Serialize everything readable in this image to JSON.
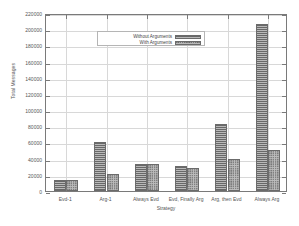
{
  "chart_data": {
    "type": "bar",
    "title": "",
    "xlabel": "Strategy",
    "ylabel": "Total Messages",
    "categories": [
      "Evd-1",
      "Arg-1",
      "Always Evd",
      "Evd, Finally Arg",
      "Arg, then Evd",
      "Always Arg"
    ],
    "series": [
      {
        "name": "Without Arguments",
        "values": [
          14000,
          61000,
          33500,
          31000,
          82500,
          206000
        ]
      },
      {
        "name": "With Arguments",
        "values": [
          14000,
          21000,
          33500,
          29000,
          39000,
          51000
        ]
      }
    ],
    "ylim": [
      0,
      220000
    ],
    "ytick_step": 20000,
    "ytick_labels": [
      "0",
      "20000",
      "40000",
      "60000",
      "80000",
      "100000",
      "120000",
      "140000",
      "160000",
      "180000",
      "200000",
      "220000"
    ],
    "grid": true,
    "legend_position": "top-left",
    "bar_fill": "crosshatch",
    "colors": {
      "bar": "#b9b9b9",
      "bar_edge": "#6b6b6b",
      "grid": "#d8d8d8",
      "axis": "#7a7a7a",
      "text": "#555555"
    }
  },
  "legend": {
    "entries": [
      {
        "label": "Without Arguments"
      },
      {
        "label": "With Arguments"
      }
    ]
  }
}
